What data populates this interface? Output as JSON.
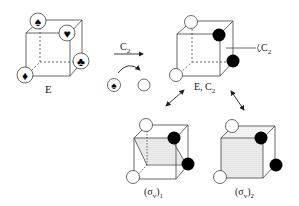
{
  "colors": {
    "line": "#333333",
    "filled_vertex": "#000000",
    "empty_vertex": "#ffffff",
    "shading": "#c8c8c8"
  },
  "cube_E": {
    "label": "E",
    "vertices": [
      {
        "position": "top-back-left",
        "symbol": "spade"
      },
      {
        "position": "top-front-right",
        "symbol": "heart"
      },
      {
        "position": "bottom-back-right",
        "symbol": "club"
      },
      {
        "position": "bottom-front-left",
        "symbol": "diamond"
      }
    ]
  },
  "operation": {
    "label": "C",
    "subscript": "2",
    "example": {
      "from": "spade",
      "to": "empty-circle"
    }
  },
  "cube_EC2": {
    "label_main": "E, C",
    "label_sub": "2",
    "axis_label": "C",
    "axis_sub": "2",
    "vertices": [
      {
        "position": "top-back-left",
        "fill": "empty"
      },
      {
        "position": "top-front-right",
        "fill": "filled"
      },
      {
        "position": "bottom-back-right",
        "fill": "filled"
      },
      {
        "position": "bottom-front-left",
        "fill": "empty"
      }
    ]
  },
  "cube_sv1": {
    "label_main": "(σ",
    "label_sub": "v",
    "label_close": ")",
    "label_index": "1",
    "plane": "diagonal"
  },
  "cube_sv2": {
    "label_main": "(σ",
    "label_sub": "v",
    "label_close": ")",
    "label_index": "2",
    "plane": "diagonal-alt"
  }
}
